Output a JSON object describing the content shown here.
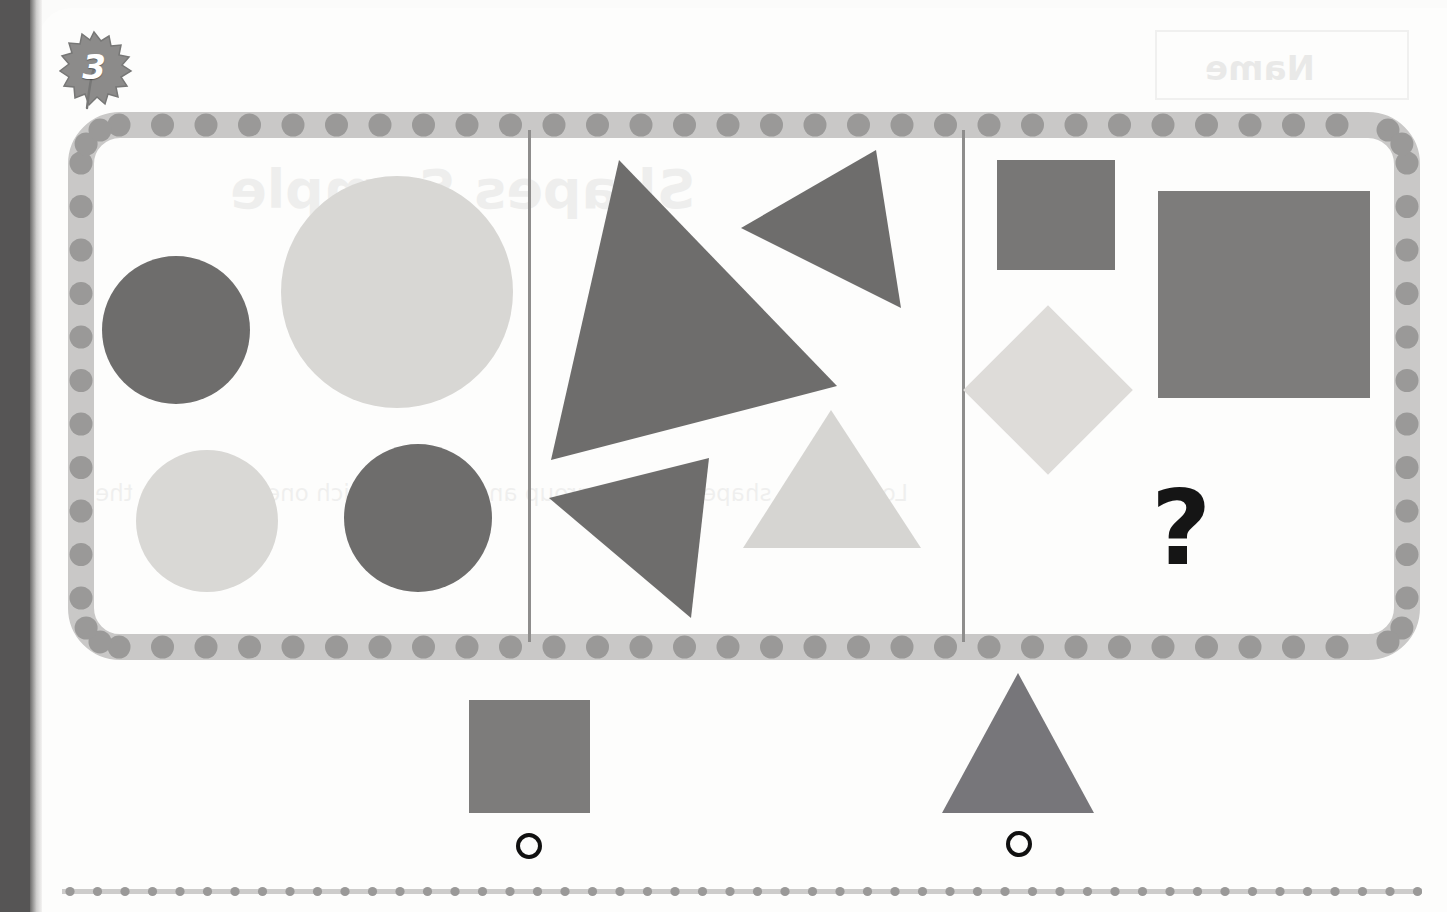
{
  "worksheet": {
    "item_number": "3",
    "badge_shape": "leaf",
    "missing_marker": "?",
    "showthrough": {
      "title": "Shapes Sample",
      "name_label": "Name",
      "instruction": "Look at the shapes in each group and decide which one belongs in the"
    }
  },
  "colors": {
    "dark_gray": "#6e6d6c",
    "mid_gray": "#7d7c7b",
    "light_gray": "#d4d4d2",
    "lighter_gray": "#dedcd9",
    "border_band": "#c9c8c7",
    "border_dot": "#9a9998",
    "divider": "#8e8d8c",
    "ink_black": "#151515",
    "page_white": "#fdfdfc",
    "scan_edge": "#565555"
  },
  "puzzle": {
    "type": "shape-analogy-matrix",
    "panels": [
      {
        "id": "panel-circles",
        "category": "circles",
        "count": 4,
        "shapes": [
          {
            "name": "small-dark-circle",
            "form": "circle",
            "tone": "dark",
            "size": 148,
            "x": 8,
            "y": 118
          },
          {
            "name": "large-light-circle",
            "form": "circle",
            "tone": "light",
            "size": 232,
            "x": 187,
            "y": 38
          },
          {
            "name": "medium-light-circle",
            "form": "circle",
            "tone": "light",
            "size": 142,
            "x": 42,
            "y": 312
          },
          {
            "name": "medium-dark-circle",
            "form": "circle",
            "tone": "dark",
            "size": 148,
            "x": 250,
            "y": 306
          }
        ]
      },
      {
        "id": "panel-triangles",
        "category": "triangles",
        "count": 4,
        "shapes": [
          {
            "name": "large-dark-triangle-tilted",
            "form": "triangle",
            "tone": "dark",
            "rotation": "tilted-right"
          },
          {
            "name": "small-dark-triangle-right",
            "form": "triangle",
            "tone": "dark",
            "rotation": "pointing-down-right"
          },
          {
            "name": "small-dark-triangle-left",
            "form": "triangle",
            "tone": "dark",
            "rotation": "pointing-left"
          },
          {
            "name": "light-triangle-upright",
            "form": "triangle",
            "tone": "light",
            "rotation": "upright"
          }
        ]
      },
      {
        "id": "panel-squares",
        "category": "squares",
        "count": 3,
        "has_missing_slot": true,
        "shapes": [
          {
            "name": "small-gray-square",
            "form": "square",
            "tone": "mid",
            "size": 118,
            "x": 135,
            "y": 20
          },
          {
            "name": "large-gray-square",
            "form": "square",
            "tone": "mid",
            "size": 212,
            "x": 298,
            "y": 52
          },
          {
            "name": "light-gray-diamond",
            "form": "diamond",
            "tone": "light",
            "size": 118,
            "x": 130,
            "y": 190
          }
        ]
      }
    ]
  },
  "answers": {
    "options": [
      {
        "id": "option-a",
        "shape_name": "gray-square",
        "form": "square",
        "tone": "mid",
        "selected": false
      },
      {
        "id": "option-b",
        "shape_name": "gray-triangle",
        "form": "triangle",
        "tone": "mid",
        "selected": false
      }
    ]
  }
}
